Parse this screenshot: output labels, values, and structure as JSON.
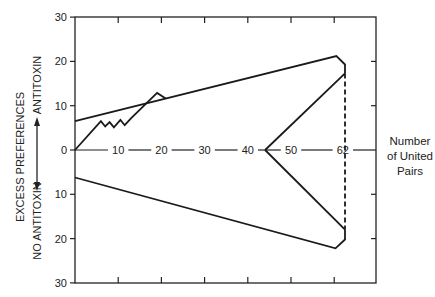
{
  "chart_data": {
    "type": "line",
    "title": "",
    "xlabel": "Number of United Pairs",
    "ylabel": "EXCESS PREFERENCES",
    "ylabel_positive": "ANTITOXIN",
    "ylabel_negative": "NO ANTITOXIN",
    "xlim": [
      0,
      70
    ],
    "ylim": [
      -30,
      30
    ],
    "x_tick_labels": [
      "10",
      "20",
      "30",
      "40",
      "50",
      "62"
    ],
    "x_tick_values": [
      10,
      20,
      30,
      40,
      50,
      62
    ],
    "y_tick_labels_top": [
      "30",
      "20",
      "10",
      "0"
    ],
    "y_tick_labels_bottom": [
      "10",
      "20",
      "30"
    ],
    "y_tick_values": [
      30,
      20,
      10,
      0,
      -10,
      -20,
      -30
    ],
    "grid": false,
    "series": [
      {
        "name": "Observed excess preferences",
        "style": "solid",
        "points": [
          [
            0,
            0
          ],
          [
            6,
            6.5
          ],
          [
            7,
            5.3
          ],
          [
            8,
            6.3
          ],
          [
            9,
            5.1
          ],
          [
            10.5,
            6.8
          ],
          [
            11.5,
            5.6
          ],
          [
            13,
            7.2
          ],
          [
            19,
            12.9
          ],
          [
            21,
            11.6
          ]
        ]
      },
      {
        "name": "Upper boundary",
        "style": "solid",
        "points": [
          [
            0,
            6.5
          ],
          [
            60.5,
            21.2
          ],
          [
            62.5,
            19.3
          ],
          [
            62.5,
            17.3
          ]
        ]
      },
      {
        "name": "Lower boundary",
        "style": "solid",
        "points": [
          [
            0,
            -6.2
          ],
          [
            60.3,
            -22.2
          ],
          [
            62.5,
            -20.2
          ],
          [
            62.5,
            -18
          ]
        ]
      },
      {
        "name": "Upper branch from 44",
        "style": "solid",
        "points": [
          [
            44,
            0
          ],
          [
            62.5,
            17.3
          ]
        ]
      },
      {
        "name": "Lower branch from 44",
        "style": "solid",
        "points": [
          [
            44,
            0
          ],
          [
            62.5,
            -18
          ]
        ]
      },
      {
        "name": "Terminal marker at 62",
        "style": "dashed",
        "points": [
          [
            62.5,
            17.3
          ],
          [
            62.5,
            -18
          ]
        ]
      }
    ]
  },
  "labels": {
    "y_main": "EXCESS PREFERENCES",
    "y_positive": "ANTITOXIN",
    "y_negative": "NO ANTITOXIN",
    "x_title_lines": [
      "Number",
      "of United",
      "Pairs"
    ]
  }
}
